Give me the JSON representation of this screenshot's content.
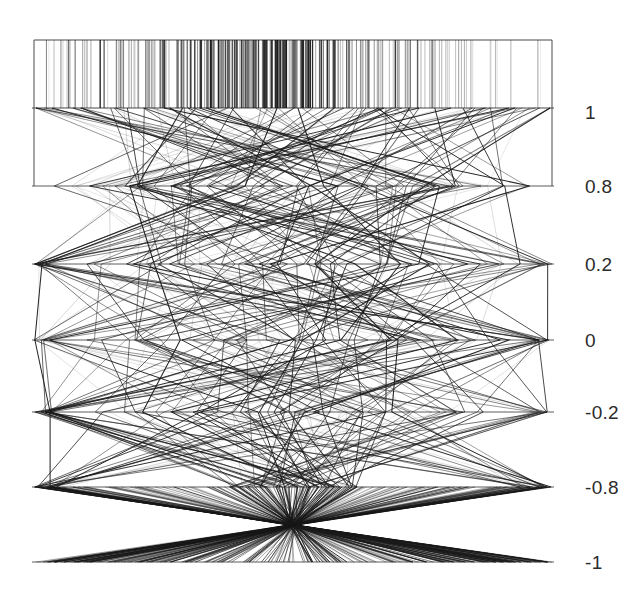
{
  "figure": {
    "type": "parallel-coordinates-plot",
    "background_color": "#ffffff",
    "line_color": "#1a1a1a",
    "axis_color": "#4a4a4a",
    "width": 638,
    "height": 592
  },
  "chart_data": {
    "type": "line",
    "title": "",
    "xlabel": "",
    "ylabel": "",
    "grid": false,
    "legend": "none",
    "axis_orientation": "horizontal-parallel-axes",
    "tick_label_position": "right",
    "axis_values": [
      1,
      0.8,
      0.2,
      0,
      -0.2,
      -0.8,
      -1
    ],
    "tick_labels": [
      "1",
      "0.8",
      "0.2",
      "0",
      "-0.2",
      "-0.8",
      "-1"
    ],
    "axis_pixel_y": [
      108,
      186,
      264,
      340,
      412,
      487,
      562
    ],
    "axis_x_start": 34,
    "axis_x_end": 552,
    "plot_top_y": 40,
    "ylim": [
      -1,
      1
    ],
    "convergence_point": {
      "x": 293,
      "y": 525
    },
    "series_count": 120,
    "series": [
      {
        "name": "s1",
        "values": [
          1,
          1,
          0.8,
          0.2,
          0,
          -0.2,
          -0.8,
          -1
        ]
      },
      {
        "name": "s2",
        "values": [
          1,
          0.8,
          0.2,
          0,
          -0.2,
          -0.8,
          -1,
          -1
        ]
      }
    ]
  },
  "tick_labels": [
    {
      "text": "1",
      "y": 112
    },
    {
      "text": "0.8",
      "y": 186
    },
    {
      "text": "0.2",
      "y": 264
    },
    {
      "text": "0",
      "y": 340
    },
    {
      "text": "-0.2",
      "y": 412
    },
    {
      "text": "-0.8",
      "y": 487
    },
    {
      "text": "-1",
      "y": 562
    }
  ]
}
